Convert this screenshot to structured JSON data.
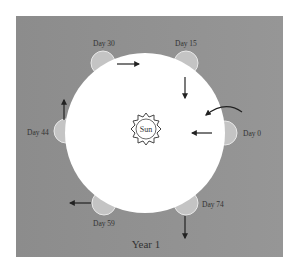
{
  "title": "Year 1",
  "sun": {
    "label": "Sun"
  },
  "colors": {
    "background": "#8f8f8f",
    "orbit_disc": "#ffffff",
    "planet": "#c4c4c4",
    "arrow": "#222222",
    "text": "#333333"
  },
  "positions": [
    {
      "label": "Day 0",
      "side": "right"
    },
    {
      "label": "Day 15",
      "side": "top-right"
    },
    {
      "label": "Day 30",
      "side": "top-left"
    },
    {
      "label": "Day 44",
      "side": "left"
    },
    {
      "label": "Day 59",
      "side": "bottom-left"
    },
    {
      "label": "Day 74",
      "side": "bottom-right"
    }
  ]
}
